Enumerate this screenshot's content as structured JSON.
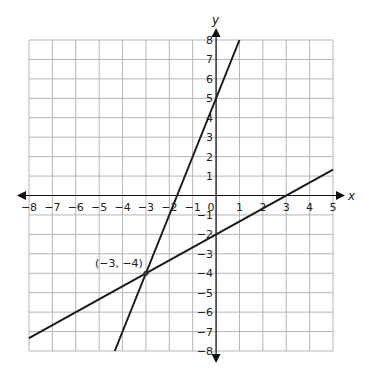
{
  "chart_data": {
    "type": "line",
    "title": "",
    "xlabel": "x",
    "ylabel": "y",
    "xlim": [
      -8,
      5
    ],
    "ylim": [
      -8,
      8
    ],
    "grid": true,
    "x_ticks": [
      -8,
      -7,
      -6,
      -5,
      -4,
      -3,
      -2,
      -1,
      0,
      1,
      2,
      3,
      4,
      5
    ],
    "y_ticks": [
      -8,
      -7,
      -6,
      -5,
      -4,
      -3,
      -2,
      -1,
      1,
      2,
      3,
      4,
      5,
      6,
      7,
      8
    ],
    "x_tick_labels": [
      "−8",
      "−7",
      "−6",
      "−5",
      "−4",
      "−3",
      "−2",
      "−1",
      "0",
      "1",
      "2",
      "3",
      "4",
      "5"
    ],
    "y_tick_labels": [
      "−8",
      "−7",
      "−6",
      "−5",
      "−4",
      "−3",
      "−2",
      "−1",
      "1",
      "2",
      "3",
      "4",
      "5",
      "6",
      "7",
      "8"
    ],
    "series": [
      {
        "name": "line-steep",
        "equation": "y = 3x + 5",
        "points": [
          [
            -4.333,
            -8
          ],
          [
            1,
            8
          ]
        ]
      },
      {
        "name": "line-shallow",
        "equation": "y = (2/3)x - 2",
        "points": [
          [
            -8,
            -7.333
          ],
          [
            5,
            1.333
          ]
        ]
      }
    ],
    "annotations": [
      {
        "label": "(−3, −4)",
        "x": -3,
        "y": -4
      }
    ]
  }
}
